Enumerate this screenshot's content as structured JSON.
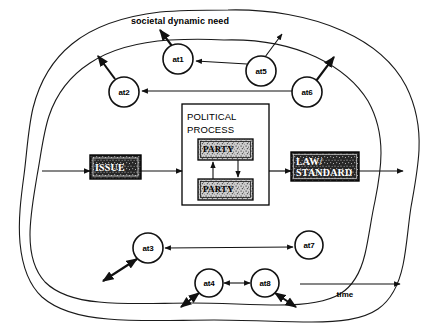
{
  "diagram": {
    "title": "societal dynamic need",
    "time_axis_label": "time",
    "process_box": {
      "title_line1": "POLITICAL",
      "title_line2": "PROCESS",
      "party_top": "PARTY",
      "party_bottom": "PARTY"
    },
    "flow_boxes": {
      "issue": "ISSUE",
      "law_line1": "LAW/",
      "law_line2": "STANDARD"
    },
    "nodes": [
      {
        "id": "at1",
        "label": "at1",
        "cx": 178,
        "cy": 59,
        "r": 15
      },
      {
        "id": "at2",
        "label": "at2",
        "cx": 124,
        "cy": 92,
        "r": 15
      },
      {
        "id": "at3",
        "label": "at3",
        "cx": 148,
        "cy": 248,
        "r": 15
      },
      {
        "id": "at4",
        "label": "at4",
        "cx": 209,
        "cy": 283,
        "r": 14
      },
      {
        "id": "at5",
        "label": "at5",
        "cx": 261,
        "cy": 71,
        "r": 15
      },
      {
        "id": "at6",
        "label": "at6",
        "cx": 307,
        "cy": 92,
        "r": 15
      },
      {
        "id": "at7",
        "label": "at7",
        "cx": 309,
        "cy": 245,
        "r": 14
      },
      {
        "id": "at8",
        "label": "at8",
        "cx": 265,
        "cy": 283,
        "r": 14
      }
    ],
    "colors": {
      "ink": "#111111",
      "background": "#ffffff",
      "box_fill_dark": "#2b2b2b"
    }
  }
}
